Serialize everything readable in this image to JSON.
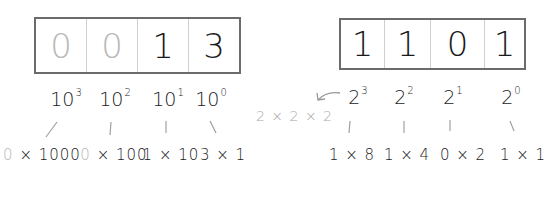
{
  "decimal": {
    "digits": [
      {
        "value": "0",
        "faded": true
      },
      {
        "value": "0",
        "faded": true
      },
      {
        "value": "1",
        "faded": false
      },
      {
        "value": "3",
        "faded": false
      }
    ],
    "powers": [
      {
        "base": "10",
        "exp": "3"
      },
      {
        "base": "10",
        "exp": "2"
      },
      {
        "base": "10",
        "exp": "1"
      },
      {
        "base": "10",
        "exp": "0"
      }
    ],
    "products": [
      {
        "digit": "0",
        "rest": "× 1000",
        "faded": true
      },
      {
        "digit": "0",
        "rest": "× 100",
        "faded": true
      },
      {
        "digit": "1",
        "rest": "× 10",
        "faded": false
      },
      {
        "digit": "3",
        "rest": "× 1",
        "faded": false
      }
    ]
  },
  "binary": {
    "digits": [
      {
        "value": "1"
      },
      {
        "value": "1"
      },
      {
        "value": "0"
      },
      {
        "value": "1"
      }
    ],
    "powers": [
      {
        "base": "2",
        "exp": "3"
      },
      {
        "base": "2",
        "exp": "2"
      },
      {
        "base": "2",
        "exp": "1"
      },
      {
        "base": "2",
        "exp": "0"
      }
    ],
    "products": [
      {
        "digit": "1",
        "rest": "× 8"
      },
      {
        "digit": "1",
        "rest": "× 4"
      },
      {
        "digit": "0",
        "rest": "× 2"
      },
      {
        "digit": "1",
        "rest": "× 1"
      }
    ],
    "annotation": "2 × 2 × 2"
  },
  "colors": {
    "ink": "#1a1a1a",
    "faded": "#b9b9b9",
    "border": "#6b6b6b"
  }
}
